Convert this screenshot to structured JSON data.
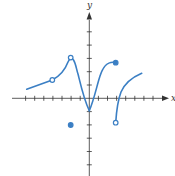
{
  "chart_data": {
    "type": "line",
    "title": "",
    "xlabel": "x",
    "ylabel": "y",
    "xlim": [
      -7,
      7
    ],
    "ylim": [
      -6,
      6
    ],
    "grid": false,
    "x_tick_step": 1,
    "y_tick_step": 1,
    "colors": {
      "curve": "#3b7fc4",
      "axis": "#333333"
    },
    "series": [
      {
        "name": "left-piece",
        "points": [
          [
            -6.9,
            0.7
          ],
          [
            -4,
            1.4
          ],
          [
            -3,
            2.0
          ],
          [
            -2.5,
            2.6
          ],
          [
            -2,
            3
          ],
          [
            -1.5,
            2.4
          ],
          [
            -1.2,
            2.1
          ],
          [
            -0.5,
            0
          ],
          [
            0,
            -1
          ]
        ],
        "note": "open circle at x=-4 (y≈1.4), open circle at peak x=-2 (y=3)"
      },
      {
        "name": "middle-piece",
        "points": [
          [
            0,
            -1
          ],
          [
            0.5,
            0.5
          ],
          [
            1.2,
            2.0
          ],
          [
            2,
            2.7
          ],
          [
            3,
            2.7
          ]
        ],
        "note": "filled dot at x=3"
      },
      {
        "name": "right-piece",
        "points": [
          [
            3,
            -2
          ],
          [
            3.2,
            -0.5
          ],
          [
            3.5,
            0
          ],
          [
            4,
            0.9
          ],
          [
            5,
            1.5
          ],
          [
            5.8,
            1.9
          ]
        ],
        "note": "open circle at x=3 (y=-2)"
      }
    ],
    "markers": [
      {
        "x": -4,
        "y": 1.4,
        "style": "open"
      },
      {
        "x": -2,
        "y": 3,
        "style": "open"
      },
      {
        "x": -2,
        "y": -2,
        "style": "filled"
      },
      {
        "x": 3,
        "y": 2.7,
        "style": "filled"
      },
      {
        "x": 3,
        "y": -2,
        "style": "open"
      }
    ],
    "annotations": [
      "piecewise function with jump discontinuities at x=-2 and x=3, removable discontinuity at x=-4"
    ]
  },
  "labels": {
    "x_axis": "x",
    "y_axis": "y"
  }
}
